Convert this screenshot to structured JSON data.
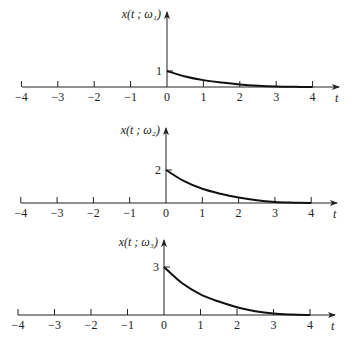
{
  "chart_data": [
    {
      "type": "line",
      "title": "",
      "ylabel": "x(t ; ω₁)",
      "xlabel": "t",
      "xlim": [
        -4,
        4
      ],
      "xticks": [
        -4,
        -3,
        -2,
        -1,
        0,
        1,
        2,
        3,
        4
      ],
      "xtick_labels": [
        "−4",
        "−3",
        "−2",
        "−1",
        "0",
        "1",
        "2",
        "3",
        "4"
      ],
      "ytick_value": 1,
      "ytick_label": "1",
      "grid": false,
      "series": [
        {
          "name": "x(t; ω1)",
          "x": [
            0,
            0.5,
            1,
            1.5,
            2,
            2.5,
            3,
            3.5,
            4
          ],
          "y": [
            1,
            0.66,
            0.43,
            0.28,
            0.16,
            0.08,
            0.03,
            0.01,
            0
          ]
        }
      ]
    },
    {
      "type": "line",
      "title": "",
      "ylabel": "x(t ; ω₂)",
      "xlabel": "t",
      "xlim": [
        -4,
        4
      ],
      "xticks": [
        -4,
        -3,
        -2,
        -1,
        0,
        1,
        2,
        3,
        4
      ],
      "xtick_labels": [
        "−4",
        "−3",
        "−2",
        "−1",
        "0",
        "1",
        "2",
        "3",
        "4"
      ],
      "ytick_value": 2,
      "ytick_label": "2",
      "grid": false,
      "series": [
        {
          "name": "x(t; ω2)",
          "x": [
            0,
            0.5,
            1,
            1.5,
            2,
            2.5,
            3,
            3.5,
            4
          ],
          "y": [
            2,
            1.32,
            0.86,
            0.56,
            0.33,
            0.16,
            0.06,
            0.02,
            0
          ]
        }
      ]
    },
    {
      "type": "line",
      "title": "",
      "ylabel": "x(t ; ω₃)",
      "xlabel": "t",
      "xlim": [
        -4,
        4
      ],
      "xticks": [
        -4,
        -3,
        -2,
        -1,
        0,
        1,
        2,
        3,
        4
      ],
      "xtick_labels": [
        "−4",
        "−3",
        "−2",
        "−1",
        "0",
        "1",
        "2",
        "3",
        "4"
      ],
      "ytick_value": 3,
      "ytick_label": "3",
      "grid": false,
      "series": [
        {
          "name": "x(t; ω3)",
          "x": [
            0,
            0.5,
            1,
            1.5,
            2,
            2.5,
            3,
            3.5,
            4
          ],
          "y": [
            3,
            1.98,
            1.29,
            0.84,
            0.49,
            0.24,
            0.09,
            0.03,
            0
          ]
        }
      ]
    }
  ]
}
